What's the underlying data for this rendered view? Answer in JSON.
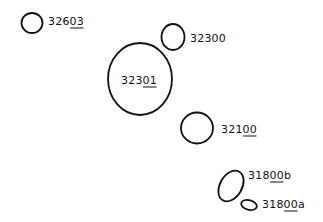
{
  "diagram": {
    "type": "site-outline-map",
    "background": "#ffffff",
    "stroke_color": "#111111",
    "features": [
      {
        "id": "f32603",
        "label_main": "326",
        "label_underlined": "03",
        "label_suffix": "",
        "shape": {
          "cx": 32,
          "cy": 23,
          "rx": 10.5,
          "ry": 10,
          "rotate": 0
        },
        "label_pos": {
          "x": 48,
          "y": 25
        }
      },
      {
        "id": "f32300",
        "label_main": "32300",
        "label_underlined": "",
        "label_suffix": "",
        "shape": {
          "cx": 173,
          "cy": 37,
          "rx": 11.5,
          "ry": 13,
          "rotate": 0
        },
        "label_pos": {
          "x": 190,
          "y": 42
        }
      },
      {
        "id": "f32301",
        "label_main": "323",
        "label_underlined": "01",
        "label_suffix": "",
        "shape": {
          "cx": 140,
          "cy": 79,
          "rx": 32,
          "ry": 36,
          "rotate": 0
        },
        "label_pos": {
          "x": 121,
          "y": 84
        }
      },
      {
        "id": "f32100",
        "label_main": "321",
        "label_underlined": "00",
        "label_suffix": "",
        "shape": {
          "cx": 197,
          "cy": 128,
          "rx": 16,
          "ry": 15.5,
          "rotate": 0
        },
        "label_pos": {
          "x": 221,
          "y": 133
        }
      },
      {
        "id": "f31800b",
        "label_main": "318",
        "label_underlined": "00",
        "label_suffix": "b",
        "shape": {
          "cx": 231,
          "cy": 186,
          "rx": 11,
          "ry": 16.5,
          "rotate": 30
        },
        "label_pos": {
          "x": 248,
          "y": 179
        }
      },
      {
        "id": "f31800a",
        "label_main": "318",
        "label_underlined": "00",
        "label_suffix": "a",
        "shape": {
          "cx": 249,
          "cy": 205,
          "rx": 8,
          "ry": 4.8,
          "rotate": 15
        },
        "label_pos": {
          "x": 262,
          "y": 208
        }
      }
    ]
  }
}
